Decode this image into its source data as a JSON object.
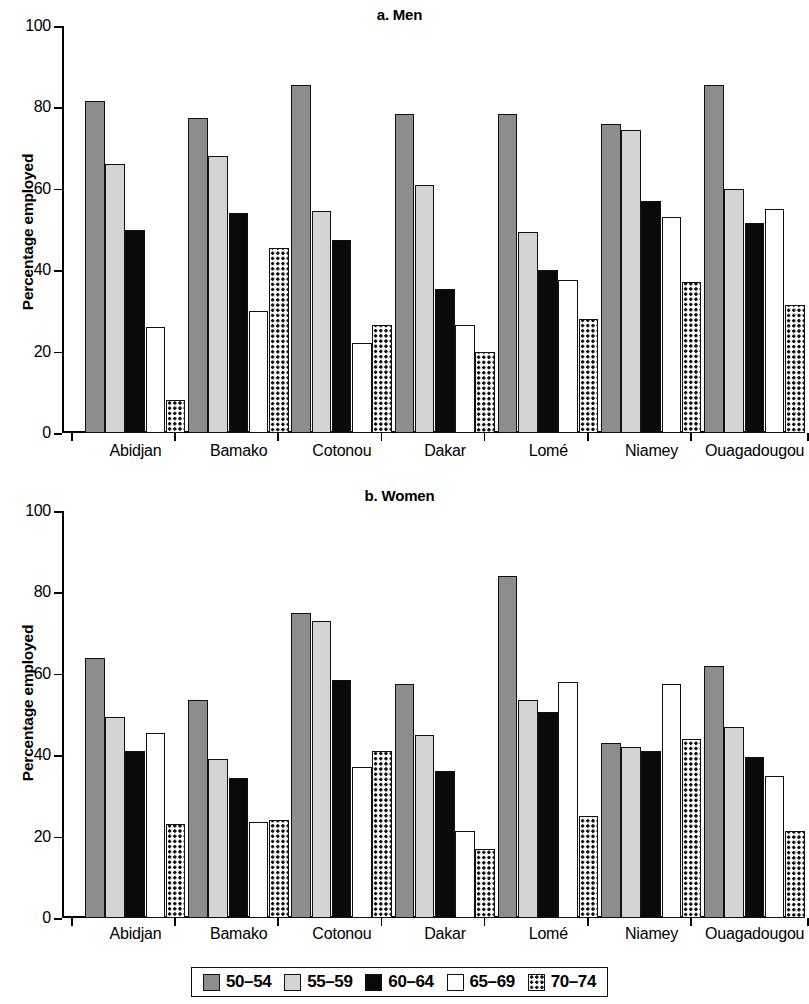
{
  "figure": {
    "ylabel": "Percentage employed",
    "yticks": [
      0,
      20,
      40,
      60,
      80,
      100
    ],
    "ylim": [
      0,
      100
    ],
    "categories": [
      "Abidjan",
      "Bamako",
      "Cotonou",
      "Dakar",
      "Lomé",
      "Niamey",
      "Ouagadougou"
    ],
    "legend": [
      {
        "label": "50–54",
        "pattern": "solid-dark-gray",
        "color": "#8d8d8d"
      },
      {
        "label": "55–59",
        "pattern": "solid-light-gray",
        "color": "#d4d4d4"
      },
      {
        "label": "60–64",
        "pattern": "solid-black",
        "color": "#0a0a0a"
      },
      {
        "label": "65–69",
        "pattern": "solid-white",
        "color": "#ffffff"
      },
      {
        "label": "70–74",
        "pattern": "white-with-black-dots",
        "color": "#ffffff"
      }
    ]
  },
  "panels": [
    {
      "id": "men",
      "title": "a. Men"
    },
    {
      "id": "women",
      "title": "b. Women"
    }
  ],
  "chart_data": [
    {
      "type": "bar",
      "title": "a. Men",
      "xlabel": "",
      "ylabel": "Percentage employed",
      "ylim": [
        0,
        100
      ],
      "yticks": [
        0,
        20,
        40,
        60,
        80,
        100
      ],
      "grid": false,
      "legend_position": "bottom-shared",
      "categories": [
        "Abidjan",
        "Bamako",
        "Cotonou",
        "Dakar",
        "Lomé",
        "Niamey",
        "Ouagadougou"
      ],
      "series": [
        {
          "name": "50–54",
          "values": [
            81.5,
            77.5,
            85.5,
            78.5,
            78.5,
            76.0,
            85.5
          ]
        },
        {
          "name": "55–59",
          "values": [
            66.0,
            68.0,
            54.5,
            61.0,
            49.5,
            74.5,
            60.0
          ]
        },
        {
          "name": "60–64",
          "values": [
            50.0,
            54.0,
            47.5,
            35.5,
            40.0,
            57.0,
            51.5
          ]
        },
        {
          "name": "65–69",
          "values": [
            26.0,
            30.0,
            22.0,
            26.5,
            37.5,
            53.0,
            55.0
          ]
        },
        {
          "name": "70–74",
          "values": [
            8.0,
            45.5,
            26.5,
            20.0,
            28.0,
            37.0,
            31.5
          ]
        }
      ]
    },
    {
      "type": "bar",
      "title": "b. Women",
      "xlabel": "",
      "ylabel": "Percentage employed",
      "ylim": [
        0,
        100
      ],
      "yticks": [
        0,
        20,
        40,
        60,
        80,
        100
      ],
      "grid": false,
      "legend_position": "bottom-shared",
      "categories": [
        "Abidjan",
        "Bamako",
        "Cotonou",
        "Dakar",
        "Lomé",
        "Niamey",
        "Ouagadougou"
      ],
      "series": [
        {
          "name": "50–54",
          "values": [
            64.0,
            53.5,
            75.0,
            57.5,
            84.0,
            43.0,
            62.0
          ]
        },
        {
          "name": "55–59",
          "values": [
            49.5,
            39.0,
            73.0,
            45.0,
            53.5,
            42.0,
            47.0
          ]
        },
        {
          "name": "60–64",
          "values": [
            41.0,
            34.5,
            58.5,
            36.0,
            50.5,
            41.0,
            39.5
          ]
        },
        {
          "name": "65–69",
          "values": [
            45.5,
            23.5,
            37.0,
            21.5,
            58.0,
            57.5,
            35.0
          ]
        },
        {
          "name": "70–74",
          "values": [
            23.0,
            24.0,
            41.0,
            17.0,
            25.0,
            44.0,
            21.5
          ]
        }
      ]
    }
  ]
}
